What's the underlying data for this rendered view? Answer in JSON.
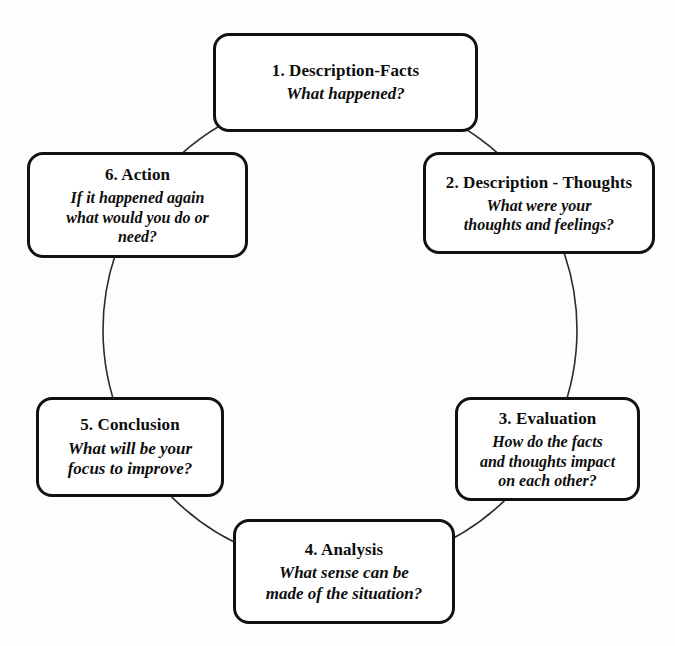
{
  "diagram": {
    "type": "cycle",
    "background_color": "#fdfdfd",
    "box_border_color": "#111111",
    "text_color": "#0d0d0d",
    "connector": {
      "name": "cycle-circle",
      "shape": "circle",
      "center_x": 340,
      "center_y": 330,
      "radius": 237,
      "stroke_color": "#2b2b2b",
      "stroke_width": 1.6
    },
    "nodes": [
      {
        "id": "1",
        "title": "1. Description-Facts",
        "question": "What happened?",
        "question_lines": [
          "What happened?"
        ],
        "position": "top"
      },
      {
        "id": "2",
        "title": "2. Description - Thoughts",
        "question": "What were your thoughts and feelings?",
        "question_lines": [
          "What were your",
          "thoughts and feelings?"
        ],
        "position": "top-right"
      },
      {
        "id": "3",
        "title": "3. Evaluation",
        "question": "How do the facts and thoughts impact on each other?",
        "question_lines": [
          "How do the facts",
          "and thoughts impact",
          "on each other?"
        ],
        "position": "bottom-right"
      },
      {
        "id": "4",
        "title": "4. Analysis",
        "question": "What sense can be made of the situation?",
        "question_lines": [
          "What sense can be",
          "made of the situation?"
        ],
        "position": "bottom"
      },
      {
        "id": "5",
        "title": "5. Conclusion",
        "question": "What will be your focus to improve?",
        "question_lines": [
          "What will be your",
          "focus to improve?"
        ],
        "position": "bottom-left"
      },
      {
        "id": "6",
        "title": "6. Action",
        "question": "If it happened again what would you do or need?",
        "question_lines": [
          "If it happened again",
          "what would you do or",
          "need?"
        ],
        "position": "top-left"
      }
    ]
  }
}
